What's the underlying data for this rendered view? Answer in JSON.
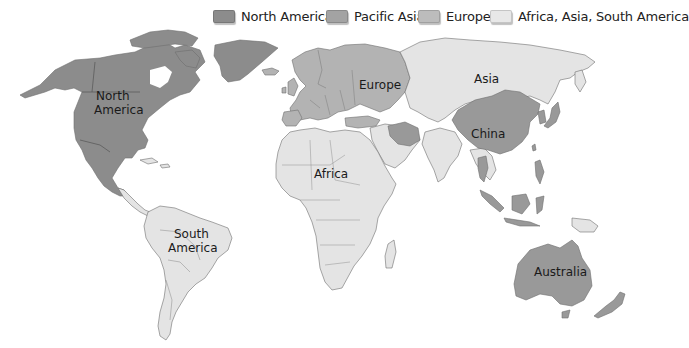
{
  "legend": {
    "items": [
      {
        "label": "North America",
        "color": "#8c8c8c",
        "icon": "swatch-dark-gray"
      },
      {
        "label": "Pacific Asia",
        "color": "#a8a8a8",
        "icon": "swatch-medium-gray"
      },
      {
        "label": "Europe",
        "color": "#bdbdbd",
        "icon": "swatch-light-gray"
      },
      {
        "label": "Africa, Asia, South America",
        "color": "#e6e6e6",
        "icon": "swatch-very-light-gray"
      }
    ]
  },
  "map": {
    "labels": {
      "north_america_1": "North",
      "north_america_2": "America",
      "europe": "Europe",
      "asia": "Asia",
      "china": "China",
      "africa": "Africa",
      "south_america_1": "South",
      "south_america_2": "America",
      "australia": "Australia"
    },
    "colors": {
      "north_america": "#8c8c8c",
      "pacific_asia": "#999999",
      "europe": "#b3b3b3",
      "rest": "#e4e4e4",
      "border": "#6f6f6f",
      "background": "#ffffff"
    }
  }
}
